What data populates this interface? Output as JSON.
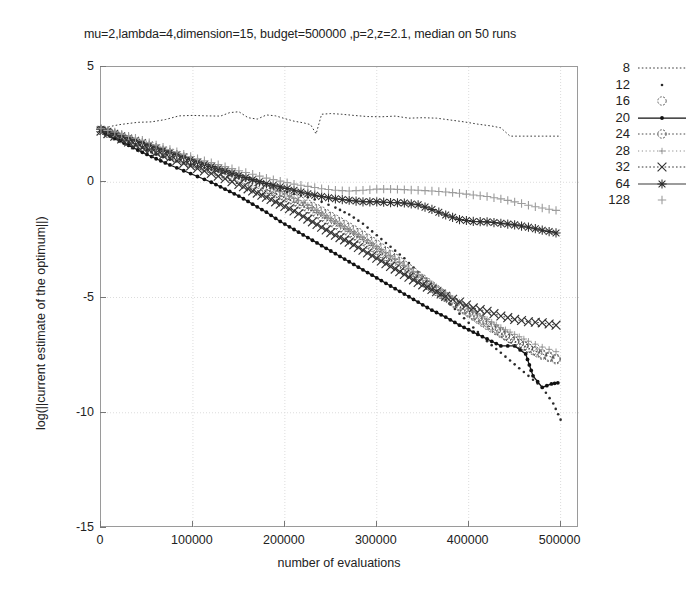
{
  "chart_data": {
    "type": "line",
    "title": "mu=2,lambda=4,dimension=15, budget=500000 ,p=2,z=2.1, median on 50 runs",
    "xlabel": "number of evaluations",
    "ylabel": "log(||current estimate of the optimum||)",
    "xlim": [
      0,
      520000
    ],
    "ylim": [
      -15,
      5
    ],
    "xticks": [
      0,
      100000,
      200000,
      300000,
      400000,
      500000
    ],
    "xtick_labels": [
      "0",
      "100000",
      "200000",
      "300000",
      "400000",
      "500000"
    ],
    "yticks": [
      5,
      0,
      -5,
      -10,
      -15
    ],
    "ytick_labels": [
      "5",
      "0",
      "-5",
      "-10",
      "-15"
    ],
    "grid": true,
    "legend_position": "right",
    "legend_title": "",
    "series": [
      {
        "name": "8",
        "style": "dotted-line",
        "marker": "none",
        "color": "#3a3a3a",
        "x": [
          0,
          10000,
          20000,
          30000,
          40000,
          55000,
          70000,
          85000,
          100000,
          115000,
          130000,
          140000,
          150000,
          160000,
          170000,
          180000,
          190000,
          200000,
          210000,
          220000,
          228000,
          234000,
          240000,
          250000,
          262000,
          275000,
          290000,
          305000,
          320000,
          335000,
          350000,
          365000,
          380000,
          395000,
          410000,
          425000,
          435000,
          445000,
          460000,
          480000,
          500000
        ],
        "y": [
          2.3,
          2.42,
          2.5,
          2.55,
          2.6,
          2.62,
          2.72,
          2.88,
          2.9,
          2.88,
          2.87,
          3.02,
          3.06,
          2.8,
          2.74,
          2.92,
          2.88,
          2.76,
          2.65,
          2.58,
          2.5,
          2.1,
          2.95,
          2.98,
          2.95,
          2.9,
          2.85,
          2.84,
          2.87,
          2.78,
          2.8,
          2.78,
          2.7,
          2.62,
          2.52,
          2.44,
          2.36,
          2.0,
          2.0,
          2.0,
          2.0
        ]
      },
      {
        "name": "12",
        "style": "none",
        "marker": "dot",
        "color": "#2b2b2b",
        "x": [
          0,
          15000,
          30000,
          45000,
          60000,
          75000,
          90000,
          105000,
          120000,
          135000,
          150000,
          165000,
          180000,
          195000,
          210000,
          225000,
          240000,
          255000,
          270000,
          285000,
          300000,
          315000,
          330000,
          345000,
          360000,
          375000,
          390000,
          405000,
          420000,
          435000,
          450000,
          465000,
          480000,
          492000,
          500000
        ],
        "y": [
          2.2,
          1.95,
          1.7,
          1.5,
          1.2,
          0.98,
          0.85,
          0.7,
          0.55,
          0.4,
          0.2,
          0.05,
          -0.15,
          -0.35,
          -0.5,
          -0.65,
          -0.85,
          -1.1,
          -1.4,
          -1.8,
          -2.3,
          -2.8,
          -3.3,
          -3.9,
          -4.5,
          -5.1,
          -5.7,
          -6.3,
          -6.9,
          -7.4,
          -7.9,
          -8.4,
          -8.9,
          -9.6,
          -10.3
        ]
      },
      {
        "name": "16",
        "style": "none",
        "marker": "circle",
        "color": "#555555",
        "x": [
          0,
          15000,
          30000,
          45000,
          60000,
          75000,
          90000,
          105000,
          120000,
          135000,
          150000,
          165000,
          180000,
          195000,
          210000,
          225000,
          240000,
          255000,
          270000,
          285000,
          300000,
          315000,
          330000,
          345000,
          360000,
          375000,
          390000,
          405000,
          420000,
          435000,
          450000,
          465000,
          480000,
          495000
        ],
        "y": [
          2.25,
          2.05,
          1.85,
          1.62,
          1.42,
          1.22,
          1.0,
          0.8,
          0.6,
          0.42,
          0.22,
          0.02,
          -0.2,
          -0.45,
          -0.7,
          -0.95,
          -1.25,
          -1.6,
          -1.95,
          -2.3,
          -2.7,
          -3.15,
          -3.6,
          -4.05,
          -4.5,
          -4.95,
          -5.35,
          -5.75,
          -6.1,
          -6.5,
          -6.9,
          -7.2,
          -7.5,
          -7.7
        ]
      },
      {
        "name": "20",
        "style": "solid-line",
        "marker": "filled-dot",
        "color": "#111111",
        "x": [
          0,
          15000,
          30000,
          45000,
          60000,
          75000,
          90000,
          105000,
          120000,
          135000,
          150000,
          165000,
          180000,
          195000,
          210000,
          225000,
          240000,
          255000,
          270000,
          285000,
          300000,
          315000,
          330000,
          345000,
          360000,
          375000,
          390000,
          405000,
          420000,
          435000,
          450000,
          462000,
          470000,
          480000,
          490000,
          497000
        ],
        "y": [
          2.2,
          1.9,
          1.6,
          1.3,
          1.02,
          0.75,
          0.5,
          0.25,
          0.0,
          -0.3,
          -0.6,
          -0.95,
          -1.3,
          -1.7,
          -2.05,
          -2.4,
          -2.75,
          -3.1,
          -3.45,
          -3.8,
          -4.15,
          -4.5,
          -4.85,
          -5.2,
          -5.55,
          -5.85,
          -6.2,
          -6.5,
          -6.8,
          -7.1,
          -7.1,
          -7.45,
          -8.4,
          -8.9,
          -8.75,
          -8.7
        ]
      },
      {
        "name": "24",
        "style": "dotted-line",
        "marker": "circle",
        "color": "#4a4a4a",
        "x": [
          0,
          15000,
          30000,
          45000,
          60000,
          75000,
          90000,
          105000,
          120000,
          135000,
          150000,
          165000,
          180000,
          195000,
          210000,
          225000,
          240000,
          255000,
          270000,
          285000,
          300000,
          315000,
          330000,
          345000,
          360000,
          375000,
          390000,
          405000,
          420000,
          435000,
          450000,
          465000,
          480000,
          495000
        ],
        "y": [
          2.25,
          2.0,
          1.78,
          1.55,
          1.35,
          1.15,
          0.95,
          0.75,
          0.55,
          0.35,
          0.15,
          -0.08,
          -0.32,
          -0.58,
          -0.85,
          -1.15,
          -1.5,
          -1.85,
          -2.2,
          -2.55,
          -2.95,
          -3.35,
          -3.8,
          -4.2,
          -4.6,
          -5.0,
          -5.4,
          -5.8,
          -6.2,
          -6.55,
          -6.9,
          -7.2,
          -7.45,
          -7.65
        ]
      },
      {
        "name": "28",
        "style": "dotted-line-light",
        "marker": "small-plus",
        "color": "#8e8e8e",
        "x": [
          0,
          15000,
          30000,
          45000,
          60000,
          75000,
          90000,
          105000,
          120000,
          135000,
          150000,
          165000,
          180000,
          195000,
          210000,
          225000,
          240000,
          255000,
          270000,
          285000,
          300000,
          315000,
          330000,
          345000,
          360000,
          375000,
          390000,
          405000,
          420000,
          435000,
          450000,
          465000,
          480000,
          495000
        ],
        "y": [
          2.28,
          2.1,
          1.9,
          1.7,
          1.5,
          1.3,
          1.1,
          0.9,
          0.7,
          0.5,
          0.3,
          0.1,
          -0.15,
          -0.4,
          -0.7,
          -1.0,
          -1.35,
          -1.7,
          -2.05,
          -2.4,
          -2.8,
          -3.2,
          -3.6,
          -4.0,
          -4.4,
          -4.8,
          -5.2,
          -5.6,
          -5.95,
          -6.3,
          -6.6,
          -6.9,
          -7.15,
          -7.35
        ]
      },
      {
        "name": "32",
        "style": "dotted-line",
        "marker": "cross",
        "color": "#333333",
        "x": [
          0,
          15000,
          30000,
          45000,
          60000,
          75000,
          90000,
          105000,
          120000,
          135000,
          150000,
          165000,
          180000,
          195000,
          210000,
          225000,
          240000,
          255000,
          270000,
          285000,
          300000,
          315000,
          330000,
          345000,
          360000,
          375000,
          390000,
          405000,
          420000,
          435000,
          450000,
          465000,
          480000,
          495000
        ],
        "y": [
          2.22,
          2.0,
          1.75,
          1.5,
          1.28,
          1.05,
          0.82,
          0.6,
          0.38,
          0.15,
          -0.1,
          -0.38,
          -0.65,
          -0.95,
          -1.25,
          -1.6,
          -1.95,
          -2.3,
          -2.6,
          -2.95,
          -3.3,
          -3.65,
          -4.0,
          -4.35,
          -4.65,
          -4.95,
          -5.2,
          -5.45,
          -5.6,
          -5.8,
          -5.95,
          -6.05,
          -6.1,
          -6.2
        ]
      },
      {
        "name": "64",
        "style": "solid-line-thin",
        "marker": "star",
        "color": "#2e2e2e",
        "x": [
          0,
          15000,
          30000,
          45000,
          60000,
          75000,
          90000,
          105000,
          120000,
          135000,
          150000,
          165000,
          180000,
          195000,
          210000,
          225000,
          240000,
          255000,
          270000,
          285000,
          300000,
          315000,
          330000,
          345000,
          360000,
          375000,
          390000,
          405000,
          420000,
          435000,
          450000,
          465000,
          480000,
          495000
        ],
        "y": [
          2.3,
          2.12,
          1.92,
          1.72,
          1.5,
          1.3,
          1.1,
          0.88,
          0.68,
          0.5,
          0.3,
          0.12,
          -0.05,
          -0.2,
          -0.35,
          -0.5,
          -0.62,
          -0.72,
          -0.78,
          -0.85,
          -0.85,
          -0.88,
          -0.9,
          -0.98,
          -1.18,
          -1.42,
          -1.62,
          -1.7,
          -1.72,
          -1.78,
          -1.85,
          -1.95,
          -2.08,
          -2.2
        ]
      },
      {
        "name": "128",
        "style": "none",
        "marker": "plus",
        "color": "#9c9c9c",
        "x": [
          0,
          15000,
          30000,
          45000,
          60000,
          75000,
          90000,
          105000,
          120000,
          135000,
          150000,
          165000,
          180000,
          195000,
          210000,
          225000,
          240000,
          255000,
          270000,
          285000,
          300000,
          315000,
          330000,
          345000,
          360000,
          375000,
          390000,
          405000,
          420000,
          435000,
          450000,
          465000,
          480000,
          495000
        ],
        "y": [
          2.32,
          2.18,
          2.0,
          1.82,
          1.62,
          1.42,
          1.22,
          1.02,
          0.85,
          0.68,
          0.5,
          0.35,
          0.18,
          0.05,
          -0.08,
          -0.18,
          -0.28,
          -0.35,
          -0.38,
          -0.35,
          -0.3,
          -0.3,
          -0.32,
          -0.35,
          -0.38,
          -0.42,
          -0.48,
          -0.55,
          -0.62,
          -0.72,
          -0.85,
          -1.0,
          -1.12,
          -1.22
        ]
      }
    ]
  },
  "legend": {
    "entries": [
      "8",
      "12",
      "16",
      "20",
      "24",
      "28",
      "32",
      "64",
      "128"
    ]
  }
}
